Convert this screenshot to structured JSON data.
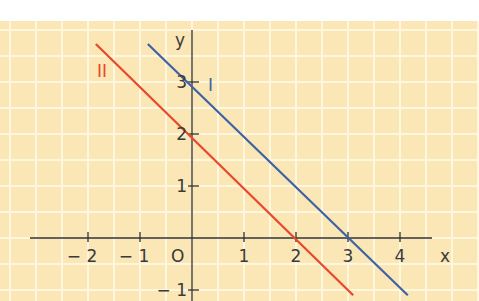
{
  "figure": {
    "background_color": "#fbe6b5",
    "grid_color": "#fff6de",
    "axis_color": "#2f2f2f",
    "axes": {
      "x_label": "x",
      "y_label": "y",
      "origin_label": "O",
      "x_ticks": [
        {
          "value": -2,
          "label": "− 2"
        },
        {
          "value": -1,
          "label": "− 1"
        },
        {
          "value": 1,
          "label": "1"
        },
        {
          "value": 2,
          "label": "2"
        },
        {
          "value": 3,
          "label": "3"
        },
        {
          "value": 4,
          "label": "4"
        }
      ],
      "y_ticks": [
        {
          "value": 3,
          "label": "3"
        },
        {
          "value": 2,
          "label": "2"
        },
        {
          "value": 1,
          "label": "1"
        },
        {
          "value": -1,
          "label": "− 1"
        }
      ]
    },
    "lines": [
      {
        "name": "I",
        "label": "I",
        "color": "#3d63a4",
        "equation": "y = -x + 3",
        "from": [
          -0.85,
          3.73
        ],
        "to": [
          4.15,
          -1.1
        ]
      },
      {
        "name": "II",
        "label": "II",
        "color": "#e8472a",
        "equation": "y = -x + 2",
        "from": [
          -1.85,
          3.73
        ],
        "to": [
          3.1,
          -1.1
        ]
      }
    ]
  }
}
